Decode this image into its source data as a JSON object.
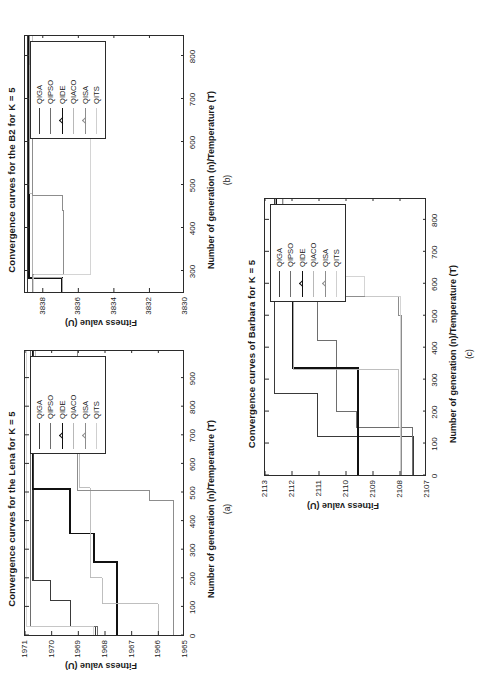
{
  "figure": {
    "series_names": [
      "QIGA",
      "QIPSO",
      "QIDE",
      "QIACO",
      "QISA",
      "QITS"
    ],
    "series_colors": [
      "#3a3a3a",
      "#6e6e6e",
      "#111111",
      "#b8b8b8",
      "#8d8d8d",
      "#cfcfcf"
    ],
    "xlabel": "Number of generation (n)/Temperature (T)",
    "ylabel": "Fitness value (U)"
  },
  "chart_data": [
    {
      "id": "a",
      "tag": "(a)",
      "type": "line",
      "title": "Convergence curves for the Lena for K = 5",
      "xlabel": "Number of generation (n)/Temperature (T)",
      "ylabel": "Fitness value (U)",
      "xlim": [
        0,
        1000
      ],
      "ylim": [
        1965,
        1971
      ],
      "xticks": [
        0,
        100,
        200,
        300,
        400,
        500,
        600,
        700,
        800,
        900
      ],
      "yticks": [
        1965,
        1966,
        1967,
        1968,
        1969,
        1970,
        1971
      ],
      "grid": false,
      "legend_position": "upper-right-inside",
      "series": [
        {
          "name": "QIGA",
          "x": [
            0,
            30,
            30,
            120,
            120,
            190,
            190,
            1000
          ],
          "y": [
            1968.35,
            1968.35,
            1969.3,
            1969.3,
            1970.05,
            1970.05,
            1970.7,
            1970.7
          ]
        },
        {
          "name": "QIPSO",
          "x": [
            0,
            30,
            30,
            1000
          ],
          "y": [
            1968.3,
            1968.3,
            1970.78,
            1970.78
          ]
        },
        {
          "name": "QIDE",
          "x": [
            0,
            255,
            255,
            355,
            355,
            510,
            510,
            1000
          ],
          "y": [
            1967.55,
            1967.55,
            1968.4,
            1968.4,
            1969.3,
            1969.3,
            1970.72,
            1970.72
          ]
        },
        {
          "name": "QIACO",
          "x": [
            0,
            110,
            110,
            200,
            200,
            515,
            515,
            860,
            860,
            1000
          ],
          "y": [
            1966.0,
            1966.0,
            1968.1,
            1968.1,
            1968.55,
            1968.55,
            1968.95,
            1968.95,
            1970.6,
            1970.6
          ]
        },
        {
          "name": "QISA",
          "x": [
            0,
            470,
            470,
            505,
            505,
            1000
          ],
          "y": [
            1965.45,
            1965.45,
            1966.35,
            1966.35,
            1969.05,
            1969.05
          ]
        },
        {
          "name": "QITS",
          "x": [
            0,
            30,
            30,
            1000
          ],
          "y": [
            1968.45,
            1968.45,
            1970.95,
            1970.95
          ]
        }
      ]
    },
    {
      "id": "b",
      "tag": "(b)",
      "type": "line",
      "title": "Convergence curves for the B2 for K = 5",
      "xlabel": "Number of generation (n)/Temperature (T)",
      "ylabel": "Fitness value (U)",
      "xlim": [
        250,
        850
      ],
      "ylim": [
        3830,
        3839
      ],
      "xticks": [
        300,
        400,
        500,
        600,
        700,
        800
      ],
      "yticks": [
        3830,
        3832,
        3834,
        3836,
        3838
      ],
      "grid": false,
      "legend_position": "upper-right-inside",
      "series": [
        {
          "name": "QIGA",
          "x": [
            250,
            850
          ],
          "y": [
            3838.85,
            3838.85
          ]
        },
        {
          "name": "QIPSO",
          "x": [
            250,
            850
          ],
          "y": [
            3838.6,
            3838.6
          ]
        },
        {
          "name": "QIDE",
          "x": [
            250,
            283,
            283,
            850
          ],
          "y": [
            3836.9,
            3836.9,
            3838.75,
            3838.75
          ]
        },
        {
          "name": "QIACO",
          "x": [
            250,
            283,
            283,
            480,
            480,
            850
          ],
          "y": [
            3836.9,
            3836.9,
            3838.6,
            3838.6,
            3838.75,
            3838.75
          ]
        },
        {
          "name": "QISA",
          "x": [
            250,
            290,
            290,
            440,
            440,
            475,
            475,
            730,
            730,
            780,
            780,
            850
          ],
          "y": [
            3838.6,
            3838.6,
            3836.85,
            3836.85,
            3836.9,
            3836.9,
            3838.6,
            3838.6,
            3838.6,
            3838.6,
            3838.75,
            3838.75
          ]
        },
        {
          "name": "QITS",
          "x": [
            250,
            290,
            290,
            640,
            640,
            690,
            690,
            740,
            740,
            790,
            790,
            850
          ],
          "y": [
            3838.5,
            3838.5,
            3835.3,
            3835.3,
            3835.3,
            3835.3,
            3836.7,
            3836.7,
            3837.45,
            3837.45,
            3838.6,
            3838.6
          ]
        }
      ]
    },
    {
      "id": "c",
      "tag": "(c)",
      "type": "line",
      "title": "Convergence curves of Barbara for K = 5",
      "xlabel": "Number of generation (n)/Temperature (T)",
      "ylabel": "Fitness value (U)",
      "xlim": [
        0,
        870
      ],
      "ylim": [
        2107,
        2113
      ],
      "xticks": [
        0,
        100,
        200,
        300,
        400,
        500,
        600,
        700,
        800
      ],
      "yticks": [
        2107,
        2108,
        2109,
        2110,
        2111,
        2112,
        2113
      ],
      "grid": false,
      "legend_position": "upper-right-inside",
      "series": [
        {
          "name": "QIGA",
          "x": [
            0,
            30,
            30,
            120,
            120,
            255,
            255,
            870
          ],
          "y": [
            2107.5,
            2107.5,
            2107.5,
            2107.5,
            2111.05,
            2111.05,
            2112.65,
            2112.65
          ]
        },
        {
          "name": "QIPSO",
          "x": [
            0,
            150,
            150,
            200,
            200,
            420,
            420,
            600,
            600,
            640,
            640,
            870
          ],
          "y": [
            2107.55,
            2107.55,
            2109.6,
            2109.6,
            2110.35,
            2110.35,
            2111.05,
            2111.05,
            2111.3,
            2111.3,
            2112.6,
            2112.6
          ]
        },
        {
          "name": "QIDE",
          "x": [
            0,
            155,
            155,
            335,
            335,
            550,
            550,
            575,
            575,
            870
          ],
          "y": [
            2109.55,
            2109.55,
            2109.55,
            2109.55,
            2111.95,
            2111.95,
            2112.0,
            2112.0,
            2112.6,
            2112.6
          ]
        },
        {
          "name": "QIACO",
          "x": [
            0,
            150,
            150,
            330,
            330,
            560,
            560,
            625,
            625,
            870
          ],
          "y": [
            2108.0,
            2108.0,
            2108.05,
            2108.05,
            2111.95,
            2111.95,
            2112.0,
            2112.0,
            2112.6,
            2112.6
          ]
        },
        {
          "name": "QISA",
          "x": [
            0,
            500,
            500,
            560,
            560,
            605,
            605,
            870
          ],
          "y": [
            2107.95,
            2107.95,
            2108.05,
            2108.05,
            2111.35,
            2111.35,
            2112.35,
            2112.35
          ]
        },
        {
          "name": "QITS",
          "x": [
            0,
            560,
            560,
            620,
            620,
            870
          ],
          "y": [
            2108.0,
            2108.0,
            2109.3,
            2109.3,
            2112.3,
            2112.3
          ]
        }
      ]
    }
  ]
}
